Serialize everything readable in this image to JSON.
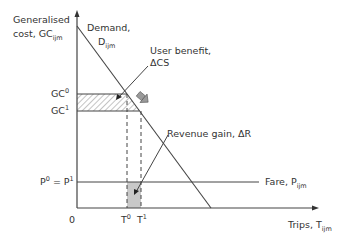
{
  "diagram": {
    "y_axis_label_line1": "Generalised",
    "y_axis_label_line2": "cost, GC",
    "y_axis_label_sub": "ijm",
    "x_axis_label": "Trips, T",
    "x_axis_label_sub": "ijm",
    "origin_label": "0",
    "demand_label_line1": "Demand,",
    "demand_label_line2": "D",
    "demand_label_sub": "ijm",
    "user_benefit_line1": "User benefit,",
    "user_benefit_line2": "ΔCS",
    "revenue_gain_label": "Revenue gain, ΔR",
    "fare_label": "Fare, P",
    "fare_label_sub": "ijm",
    "gc0_label": "GC",
    "gc0_sup": "0",
    "gc1_label": "GC",
    "gc1_sup": "1",
    "price_label_left": "P",
    "price_label_left_sup": "0",
    "price_label_eq": " = P",
    "price_label_right_sup": "1",
    "t0_label": "T",
    "t0_sup": "0",
    "t1_label": "T",
    "t1_sup": "1",
    "colors": {
      "line": "#444444",
      "hatch": "#888888",
      "revenue_fill": "#c8c8c8",
      "shift_arrow": "#777777"
    }
  }
}
